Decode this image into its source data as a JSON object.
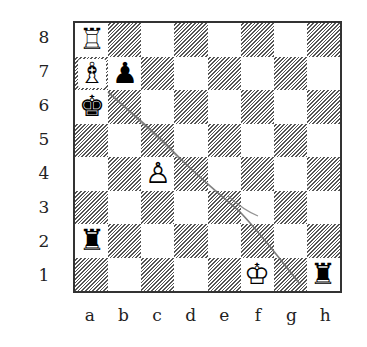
{
  "diagram": {
    "type": "chess-position",
    "ranks": [
      "8",
      "7",
      "6",
      "5",
      "4",
      "3",
      "2",
      "1"
    ],
    "files": [
      "a",
      "b",
      "c",
      "d",
      "e",
      "f",
      "g",
      "h"
    ],
    "pieces": {
      "a8": {
        "symbol": "♖",
        "color": "white",
        "name": "rook"
      },
      "a7": {
        "symbol": "♗",
        "color": "white",
        "name": "bishop"
      },
      "b7": {
        "symbol": "♟",
        "color": "black",
        "name": "pawn"
      },
      "a6": {
        "symbol": "♚",
        "color": "black",
        "name": "king"
      },
      "c4": {
        "symbol": "♙",
        "color": "white",
        "name": "pawn"
      },
      "a2": {
        "symbol": "♜",
        "color": "black",
        "name": "rook"
      },
      "f1": {
        "symbol": "♔",
        "color": "white",
        "name": "king"
      },
      "h1": {
        "symbol": "♜",
        "color": "black",
        "name": "rook"
      }
    },
    "annotation_line": {
      "description": "hand-drawn diagonal line from a7 toward g1",
      "color": "#777777"
    }
  }
}
